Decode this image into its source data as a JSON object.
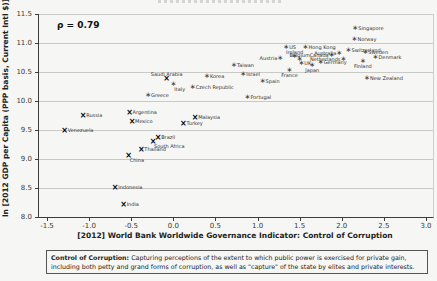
{
  "colors": {
    "grid": "#c9c9c7",
    "axis": "#3c3c3c",
    "tick_text": "#3a3a3a",
    "marker_developed": "#3a3a3a",
    "marker_emerging": "#000000",
    "point_label": "#333333"
  },
  "caption": {
    "title": "Control of Corruption:",
    "body": " Capturing perceptions of the extent to which public power is exercised for private gain, including both petty and grand forms of corruption, as well as \"capture\" of the state by elites and private interests."
  },
  "chart_data": {
    "type": "scatter",
    "title": "",
    "annotation": "ρ = 0.79",
    "xlabel": "[2012] World Bank Worldwide Governance Indicator: Control of Corruption",
    "ylabel": "ln [2012 GDP per Capita (PPP basis, Current Intl $)]",
    "xlim": [
      -1.5,
      3.0
    ],
    "ylim": [
      8.0,
      11.5
    ],
    "x_ticks": [
      "-1.5",
      "-1.0",
      "-0.5",
      "0.0",
      "0.5",
      "1.0",
      "1.5",
      "2.0",
      "2.5",
      "3.0"
    ],
    "y_ticks": [
      "8.0",
      "8.5",
      "9.0",
      "9.5",
      "10.0",
      "10.5",
      "11.0",
      "11.5"
    ],
    "grid": true,
    "legend": "none",
    "series": [
      {
        "name": "developed-economies",
        "marker": "asterisk",
        "marker_glyph": "∗",
        "points": [
          {
            "label": "Singapore",
            "x": 2.16,
            "y": 11.25,
            "label_pos": "right"
          },
          {
            "label": "Norway",
            "x": 2.15,
            "y": 11.06,
            "label_pos": "right"
          },
          {
            "label": "Hong Kong",
            "x": 1.57,
            "y": 10.92,
            "label_pos": "right"
          },
          {
            "label": "US",
            "x": 1.34,
            "y": 10.91,
            "label_pos": "right"
          },
          {
            "label": "Switzerland",
            "x": 2.08,
            "y": 10.86,
            "label_pos": "right"
          },
          {
            "label": "Sweden",
            "x": 2.28,
            "y": 10.83,
            "label_pos": "right"
          },
          {
            "label": "Australia",
            "x": 1.97,
            "y": 10.81,
            "label_pos": "left"
          },
          {
            "label": "Canada",
            "x": 1.88,
            "y": 10.78,
            "label_pos": "left"
          },
          {
            "label": "Ireland",
            "x": 1.44,
            "y": 10.76,
            "label_pos": "above"
          },
          {
            "label": "Denmark",
            "x": 2.4,
            "y": 10.75,
            "label_pos": "right"
          },
          {
            "label": "Austria",
            "x": 1.27,
            "y": 10.72,
            "label_pos": "left"
          },
          {
            "label": "Netherlands",
            "x": 2.02,
            "y": 10.71,
            "label_pos": "left"
          },
          {
            "label": "Belgium",
            "x": 1.5,
            "y": 10.7,
            "label_pos": "above"
          },
          {
            "label": "Finland",
            "x": 2.25,
            "y": 10.68,
            "label_pos": "below"
          },
          {
            "label": "Germany",
            "x": 1.75,
            "y": 10.65,
            "label_pos": "right"
          },
          {
            "label": "UK",
            "x": 1.52,
            "y": 10.63,
            "label_pos": "right"
          },
          {
            "label": "Japan",
            "x": 1.65,
            "y": 10.61,
            "label_pos": "below"
          },
          {
            "label": "Taiwan",
            "x": 0.72,
            "y": 10.6,
            "label_pos": "right"
          },
          {
            "label": "France",
            "x": 1.38,
            "y": 10.52,
            "label_pos": "below"
          },
          {
            "label": "Israel",
            "x": 0.83,
            "y": 10.45,
            "label_pos": "right"
          },
          {
            "label": "Korea",
            "x": 0.4,
            "y": 10.41,
            "label_pos": "right"
          },
          {
            "label": "New Zealand",
            "x": 2.3,
            "y": 10.38,
            "label_pos": "right"
          },
          {
            "label": "Spain",
            "x": 1.06,
            "y": 10.32,
            "label_pos": "right"
          },
          {
            "label": "Italy",
            "x": 0.0,
            "y": 10.28,
            "label_pos": "below-right"
          },
          {
            "label": "Czech Republic",
            "x": 0.23,
            "y": 10.22,
            "label_pos": "right"
          },
          {
            "label": "Greece",
            "x": -0.3,
            "y": 10.09,
            "label_pos": "right"
          },
          {
            "label": "Portugal",
            "x": 0.88,
            "y": 10.05,
            "label_pos": "right"
          }
        ]
      },
      {
        "name": "emerging-economies",
        "marker": "x-cross",
        "marker_glyph": "×",
        "points": [
          {
            "label": "Saudi Arabia",
            "x": -0.08,
            "y": 10.38,
            "label_pos": "above"
          },
          {
            "label": "Argentina",
            "x": -0.52,
            "y": 9.79,
            "label_pos": "right"
          },
          {
            "label": "Russia",
            "x": -1.07,
            "y": 9.74,
            "label_pos": "right"
          },
          {
            "label": "Malaysia",
            "x": 0.26,
            "y": 9.71,
            "label_pos": "right"
          },
          {
            "label": "Mexico",
            "x": -0.49,
            "y": 9.63,
            "label_pos": "right"
          },
          {
            "label": "Turkey",
            "x": 0.12,
            "y": 9.6,
            "label_pos": "right"
          },
          {
            "label": "Venezuela",
            "x": -1.29,
            "y": 9.48,
            "label_pos": "right"
          },
          {
            "label": "Brazil",
            "x": -0.18,
            "y": 9.37,
            "label_pos": "right"
          },
          {
            "label": "South Africa",
            "x": -0.24,
            "y": 9.3,
            "label_pos": "below-right"
          },
          {
            "label": "Thailand",
            "x": -0.38,
            "y": 9.16,
            "label_pos": "right"
          },
          {
            "label": "China",
            "x": -0.53,
            "y": 9.05,
            "label_pos": "below-right"
          },
          {
            "label": "Indonesia",
            "x": -0.69,
            "y": 8.5,
            "label_pos": "right"
          },
          {
            "label": "India",
            "x": -0.59,
            "y": 8.21,
            "label_pos": "right"
          }
        ]
      }
    ]
  }
}
